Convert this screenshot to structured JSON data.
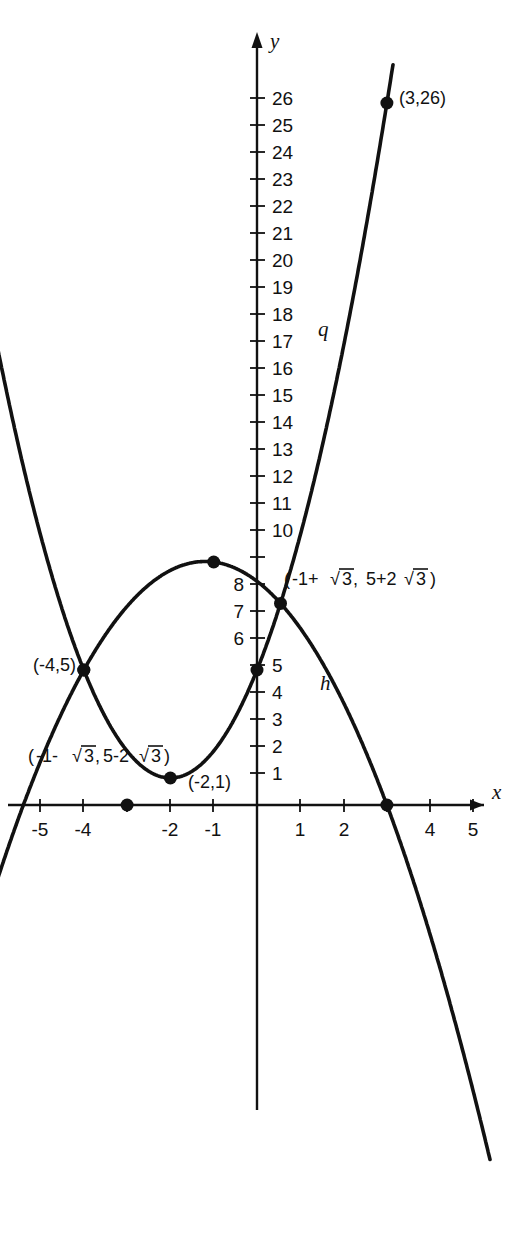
{
  "figure": {
    "background_color": "#ffffff",
    "ink_color": "#111111"
  },
  "axes": {
    "x_axis_label": "x",
    "y_axis_label": "y",
    "x_tick_labels": [
      "-5",
      "-4",
      "-2",
      "-1",
      "1",
      "2",
      "4",
      "5"
    ],
    "x_tick_values": [
      -5,
      -4,
      -2,
      -1,
      1,
      2,
      4,
      5
    ],
    "x_ticks_unlabeled": [
      -3,
      3
    ],
    "y_tick_labels_right": [
      "26",
      "25",
      "24",
      "23",
      "22",
      "21",
      "20",
      "19",
      "18",
      "17",
      "16",
      "15",
      "14",
      "13",
      "12",
      "11",
      "10",
      "5",
      "4",
      "3",
      "2",
      "1"
    ],
    "y_tick_labels_left": [
      "8",
      "7",
      "6"
    ],
    "y_tick_label_hidden": "9",
    "x_range": [
      -5.6,
      5.6
    ],
    "y_range": [
      -13,
      28
    ]
  },
  "curves": [
    {
      "name": "q",
      "label": "q",
      "type": "parabola-up",
      "opens": "up",
      "vertex": [
        -2,
        1
      ],
      "equation_points": [
        [
          -2,
          1
        ],
        [
          0,
          5
        ],
        [
          3,
          26
        ]
      ]
    },
    {
      "name": "h",
      "label": "h",
      "type": "parabola-down",
      "opens": "down",
      "vertex": [
        -1,
        9
      ],
      "equation_points": [
        [
          -4,
          5
        ],
        [
          -1,
          9
        ],
        [
          3,
          0
        ]
      ]
    }
  ],
  "marked_points": [
    {
      "name": "point-3-26",
      "label": "(3,26)",
      "x": 3,
      "y": 26
    },
    {
      "name": "point-neg4-5",
      "label": "(-4,5)",
      "x": -4,
      "y": 5
    },
    {
      "name": "point-0-5",
      "label": "",
      "x": 0,
      "y": 5
    },
    {
      "name": "point-neg2-1",
      "label": "(-2,1)",
      "x": -2,
      "y": 1
    },
    {
      "name": "point-vertex-h",
      "label": "",
      "x": -1,
      "y": 9
    },
    {
      "name": "point-root-neg3",
      "label": "",
      "x": -3,
      "y": 0
    },
    {
      "name": "point-root-3",
      "label": "",
      "x": 3,
      "y": 0
    }
  ],
  "intersection_labels": {
    "upper": {
      "name": "intersection-upper",
      "open_paren": "(",
      "x_part_prefix": "-1+",
      "x_radicand": "3",
      "comma": ", ",
      "y_part_prefix": "5+2",
      "y_radicand": "3",
      "close_paren": ")",
      "plain": "(-1+√3, 5+2√3)",
      "x": 0.732,
      "y": 8.46
    },
    "lower": {
      "name": "intersection-lower",
      "open_paren": "(",
      "x_part_prefix": "-1-",
      "x_radicand": "3",
      "comma": ",",
      "y_part_prefix": "5-2",
      "y_radicand": "3",
      "close_paren": ")",
      "plain": "(-1-√3, 5-2√3)",
      "x": -2.732,
      "y": 1.54
    }
  }
}
